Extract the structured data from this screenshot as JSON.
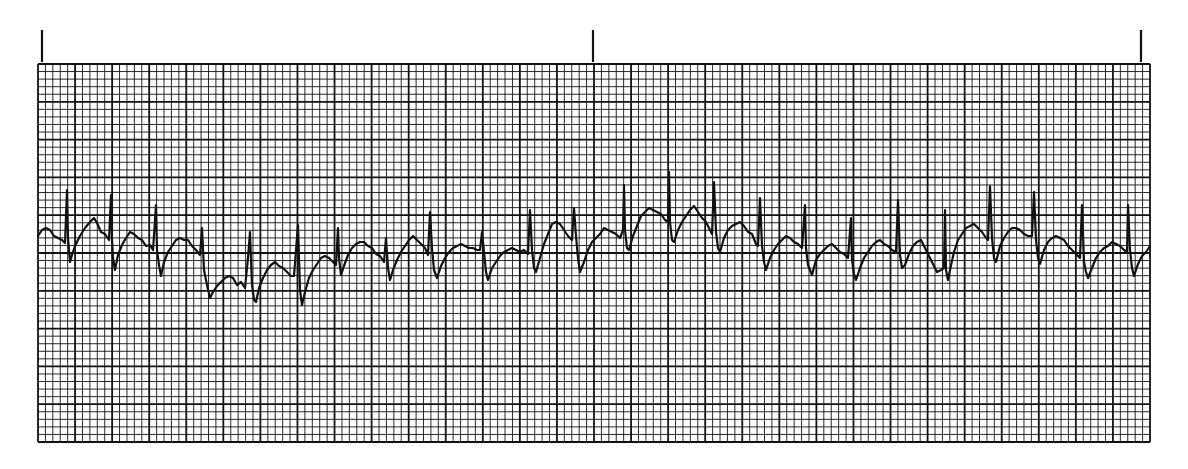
{
  "ecg_strip": {
    "grid": {
      "left": 38,
      "top": 64,
      "right": 1150,
      "bottom": 442,
      "major_cols": 30,
      "major_rows": 10,
      "minor_per_major": 5,
      "line_color": "#111111",
      "paper_color": "#ffffff"
    },
    "time_marks": [
      {
        "x": 42,
        "y_top": 30,
        "y_bottom": 62
      },
      {
        "x": 593,
        "y_top": 30,
        "y_bottom": 62
      },
      {
        "x": 1141,
        "y_top": 30,
        "y_bottom": 62
      }
    ],
    "trace": {
      "color": "#111111",
      "points": [
        [
          38,
          236
        ],
        [
          42,
          230
        ],
        [
          46,
          228
        ],
        [
          50,
          230
        ],
        [
          54,
          236
        ],
        [
          58,
          238
        ],
        [
          62,
          240
        ],
        [
          65,
          243
        ],
        [
          67,
          190
        ],
        [
          68,
          238
        ],
        [
          70,
          262
        ],
        [
          72,
          255
        ],
        [
          75,
          246
        ],
        [
          80,
          236
        ],
        [
          85,
          228
        ],
        [
          90,
          222
        ],
        [
          94,
          218
        ],
        [
          97,
          223
        ],
        [
          101,
          232
        ],
        [
          105,
          234
        ],
        [
          109,
          240
        ],
        [
          111,
          195
        ],
        [
          112,
          240
        ],
        [
          113,
          258
        ],
        [
          115,
          270
        ],
        [
          118,
          255
        ],
        [
          122,
          245
        ],
        [
          126,
          238
        ],
        [
          130,
          232
        ],
        [
          134,
          234
        ],
        [
          138,
          238
        ],
        [
          142,
          240
        ],
        [
          146,
          246
        ],
        [
          150,
          245
        ],
        [
          153,
          250
        ],
        [
          156,
          205
        ],
        [
          157,
          250
        ],
        [
          159,
          265
        ],
        [
          161,
          276
        ],
        [
          164,
          262
        ],
        [
          168,
          252
        ],
        [
          172,
          246
        ],
        [
          176,
          240
        ],
        [
          180,
          238
        ],
        [
          184,
          240
        ],
        [
          188,
          240
        ],
        [
          192,
          246
        ],
        [
          196,
          250
        ],
        [
          200,
          255
        ],
        [
          202,
          228
        ],
        [
          204,
          270
        ],
        [
          207,
          285
        ],
        [
          210,
          298
        ],
        [
          213,
          292
        ],
        [
          217,
          286
        ],
        [
          221,
          282
        ],
        [
          225,
          278
        ],
        [
          229,
          276
        ],
        [
          233,
          278
        ],
        [
          237,
          285
        ],
        [
          241,
          282
        ],
        [
          245,
          288
        ],
        [
          248,
          258
        ],
        [
          250,
          232
        ],
        [
          252,
          285
        ],
        [
          254,
          300
        ],
        [
          256,
          302
        ],
        [
          259,
          288
        ],
        [
          263,
          278
        ],
        [
          267,
          270
        ],
        [
          271,
          265
        ],
        [
          275,
          262
        ],
        [
          279,
          266
        ],
        [
          283,
          268
        ],
        [
          287,
          272
        ],
        [
          291,
          276
        ],
        [
          294,
          276
        ],
        [
          296,
          250
        ],
        [
          298,
          225
        ],
        [
          300,
          290
        ],
        [
          302,
          305
        ],
        [
          305,
          292
        ],
        [
          309,
          278
        ],
        [
          313,
          270
        ],
        [
          317,
          264
        ],
        [
          321,
          258
        ],
        [
          325,
          256
        ],
        [
          329,
          258
        ],
        [
          333,
          262
        ],
        [
          336,
          265
        ],
        [
          338,
          228
        ],
        [
          339,
          258
        ],
        [
          341,
          275
        ],
        [
          344,
          266
        ],
        [
          348,
          255
        ],
        [
          352,
          248
        ],
        [
          356,
          244
        ],
        [
          360,
          242
        ],
        [
          364,
          242
        ],
        [
          368,
          246
        ],
        [
          372,
          248
        ],
        [
          376,
          254
        ],
        [
          380,
          256
        ],
        [
          384,
          262
        ],
        [
          386,
          238
        ],
        [
          388,
          268
        ],
        [
          390,
          280
        ],
        [
          393,
          270
        ],
        [
          397,
          260
        ],
        [
          401,
          252
        ],
        [
          405,
          246
        ],
        [
          409,
          240
        ],
        [
          413,
          236
        ],
        [
          417,
          240
        ],
        [
          421,
          244
        ],
        [
          425,
          248
        ],
        [
          428,
          255
        ],
        [
          430,
          212
        ],
        [
          432,
          248
        ],
        [
          434,
          270
        ],
        [
          437,
          278
        ],
        [
          441,
          266
        ],
        [
          445,
          258
        ],
        [
          449,
          252
        ],
        [
          453,
          248
        ],
        [
          457,
          246
        ],
        [
          461,
          244
        ],
        [
          465,
          246
        ],
        [
          469,
          248
        ],
        [
          473,
          248
        ],
        [
          477,
          250
        ],
        [
          480,
          250
        ],
        [
          482,
          232
        ],
        [
          484,
          252
        ],
        [
          486,
          272
        ],
        [
          488,
          280
        ],
        [
          492,
          268
        ],
        [
          496,
          262
        ],
        [
          500,
          256
        ],
        [
          504,
          252
        ],
        [
          508,
          250
        ],
        [
          512,
          248
        ],
        [
          516,
          250
        ],
        [
          520,
          252
        ],
        [
          524,
          250
        ],
        [
          528,
          254
        ],
        [
          530,
          210
        ],
        [
          532,
          250
        ],
        [
          534,
          268
        ],
        [
          536,
          272
        ],
        [
          540,
          258
        ],
        [
          544,
          244
        ],
        [
          548,
          234
        ],
        [
          552,
          224
        ],
        [
          556,
          222
        ],
        [
          560,
          224
        ],
        [
          564,
          230
        ],
        [
          568,
          236
        ],
        [
          572,
          240
        ],
        [
          574,
          208
        ],
        [
          576,
          236
        ],
        [
          578,
          258
        ],
        [
          580,
          272
        ],
        [
          584,
          262
        ],
        [
          588,
          250
        ],
        [
          592,
          242
        ],
        [
          596,
          238
        ],
        [
          600,
          234
        ],
        [
          604,
          228
        ],
        [
          608,
          230
        ],
        [
          612,
          232
        ],
        [
          616,
          234
        ],
        [
          620,
          238
        ],
        [
          623,
          230
        ],
        [
          624,
          185
        ],
        [
          625,
          230
        ],
        [
          627,
          248
        ],
        [
          629,
          250
        ],
        [
          633,
          236
        ],
        [
          637,
          226
        ],
        [
          641,
          216
        ],
        [
          645,
          212
        ],
        [
          649,
          208
        ],
        [
          653,
          210
        ],
        [
          657,
          212
        ],
        [
          661,
          214
        ],
        [
          665,
          220
        ],
        [
          668,
          222
        ],
        [
          669,
          172
        ],
        [
          670,
          222
        ],
        [
          672,
          240
        ],
        [
          674,
          242
        ],
        [
          678,
          230
        ],
        [
          682,
          222
        ],
        [
          686,
          216
        ],
        [
          690,
          210
        ],
        [
          694,
          206
        ],
        [
          698,
          212
        ],
        [
          702,
          218
        ],
        [
          706,
          222
        ],
        [
          710,
          230
        ],
        [
          712,
          234
        ],
        [
          714,
          182
        ],
        [
          716,
          232
        ],
        [
          718,
          248
        ],
        [
          720,
          252
        ],
        [
          724,
          238
        ],
        [
          728,
          230
        ],
        [
          732,
          226
        ],
        [
          736,
          224
        ],
        [
          740,
          222
        ],
        [
          744,
          226
        ],
        [
          748,
          232
        ],
        [
          752,
          234
        ],
        [
          756,
          244
        ],
        [
          758,
          246
        ],
        [
          760,
          198
        ],
        [
          762,
          246
        ],
        [
          764,
          262
        ],
        [
          766,
          270
        ],
        [
          770,
          258
        ],
        [
          774,
          250
        ],
        [
          778,
          244
        ],
        [
          782,
          240
        ],
        [
          786,
          236
        ],
        [
          790,
          238
        ],
        [
          794,
          242
        ],
        [
          798,
          244
        ],
        [
          802,
          248
        ],
        [
          805,
          205
        ],
        [
          806,
          248
        ],
        [
          808,
          265
        ],
        [
          812,
          275
        ],
        [
          816,
          260
        ],
        [
          820,
          254
        ],
        [
          824,
          250
        ],
        [
          828,
          246
        ],
        [
          832,
          244
        ],
        [
          836,
          248
        ],
        [
          840,
          252
        ],
        [
          844,
          254
        ],
        [
          848,
          258
        ],
        [
          851,
          218
        ],
        [
          852,
          260
        ],
        [
          854,
          274
        ],
        [
          856,
          280
        ],
        [
          860,
          268
        ],
        [
          864,
          258
        ],
        [
          868,
          252
        ],
        [
          872,
          246
        ],
        [
          876,
          242
        ],
        [
          880,
          240
        ],
        [
          884,
          244
        ],
        [
          888,
          246
        ],
        [
          892,
          250
        ],
        [
          896,
          252
        ],
        [
          898,
          200
        ],
        [
          900,
          255
        ],
        [
          902,
          268
        ],
        [
          905,
          265
        ],
        [
          909,
          254
        ],
        [
          913,
          246
        ],
        [
          917,
          242
        ],
        [
          921,
          240
        ],
        [
          925,
          248
        ],
        [
          929,
          256
        ],
        [
          933,
          264
        ],
        [
          937,
          272
        ],
        [
          941,
          270
        ],
        [
          944,
          268
        ],
        [
          945,
          210
        ],
        [
          946,
          270
        ],
        [
          948,
          280
        ],
        [
          950,
          270
        ],
        [
          954,
          252
        ],
        [
          958,
          240
        ],
        [
          962,
          234
        ],
        [
          966,
          228
        ],
        [
          970,
          226
        ],
        [
          974,
          224
        ],
        [
          978,
          228
        ],
        [
          982,
          232
        ],
        [
          986,
          238
        ],
        [
          988,
          240
        ],
        [
          990,
          186
        ],
        [
          992,
          238
        ],
        [
          994,
          258
        ],
        [
          996,
          262
        ],
        [
          1000,
          246
        ],
        [
          1004,
          238
        ],
        [
          1008,
          232
        ],
        [
          1012,
          228
        ],
        [
          1016,
          228
        ],
        [
          1020,
          230
        ],
        [
          1024,
          234
        ],
        [
          1028,
          236
        ],
        [
          1032,
          236
        ],
        [
          1034,
          192
        ],
        [
          1036,
          240
        ],
        [
          1038,
          258
        ],
        [
          1040,
          264
        ],
        [
          1044,
          250
        ],
        [
          1048,
          242
        ],
        [
          1052,
          238
        ],
        [
          1056,
          236
        ],
        [
          1060,
          238
        ],
        [
          1064,
          240
        ],
        [
          1068,
          246
        ],
        [
          1072,
          250
        ],
        [
          1076,
          254
        ],
        [
          1080,
          258
        ],
        [
          1082,
          205
        ],
        [
          1084,
          262
        ],
        [
          1086,
          272
        ],
        [
          1088,
          278
        ],
        [
          1092,
          268
        ],
        [
          1096,
          258
        ],
        [
          1100,
          252
        ],
        [
          1104,
          248
        ],
        [
          1108,
          246
        ],
        [
          1112,
          242
        ],
        [
          1116,
          244
        ],
        [
          1120,
          246
        ],
        [
          1124,
          250
        ],
        [
          1127,
          252
        ],
        [
          1128,
          205
        ],
        [
          1130,
          250
        ],
        [
          1132,
          268
        ],
        [
          1134,
          276
        ],
        [
          1138,
          264
        ],
        [
          1142,
          256
        ],
        [
          1146,
          252
        ],
        [
          1150,
          246
        ]
      ]
    }
  }
}
